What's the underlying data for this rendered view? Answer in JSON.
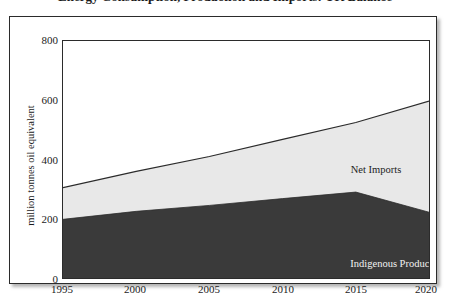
{
  "figure": {
    "title": "Energy Consumption, Production and Imports: UK Balance",
    "title_clipped": true,
    "background_color": "#ffffff",
    "frame_color": "#2b2b2b"
  },
  "chart_data": {
    "type": "area",
    "stacked": true,
    "title": "Energy Consumption, Production and Imports: UK Balance",
    "xlabel": "",
    "ylabel": "million tonnes oil equivalent",
    "x": [
      1995,
      2000,
      2005,
      2010,
      2015,
      2020
    ],
    "xlim": [
      1995,
      2020
    ],
    "ylim": [
      0,
      800
    ],
    "xticks": [
      "1995",
      "2000",
      "2005",
      "2010",
      "2015",
      "2020"
    ],
    "yticks": [
      "0",
      "200",
      "400",
      "600",
      "800"
    ],
    "ytick_values": [
      0,
      200,
      400,
      600,
      800
    ],
    "grid": false,
    "legend_position": "inline-annotation",
    "series": [
      {
        "name": "Indigenous Production",
        "values": [
          198,
          225,
          245,
          268,
          290,
          222
        ],
        "color": "#3a3a3a",
        "label_color": "#f2f2f2"
      },
      {
        "name": "Net Imports",
        "values": [
          107,
          135,
          165,
          200,
          235,
          375
        ],
        "color": "#e8e8e8",
        "label_color": "#1c1c1c"
      }
    ],
    "total_line": {
      "name": "Total Consumption",
      "values": [
        305,
        360,
        410,
        468,
        525,
        597
      ],
      "color": "#2b2b2b"
    },
    "annotations": [
      {
        "text": "Net Imports",
        "x": 2017,
        "y": 430
      },
      {
        "text": "Indigenous Production",
        "x": 2018,
        "y": 135
      }
    ]
  },
  "axis": {
    "y_label": "million tonnes oil equivalent",
    "y_ticks": [
      "800",
      "600",
      "400",
      "200",
      "0"
    ],
    "x_ticks": [
      "1995",
      "2000",
      "2005",
      "2010",
      "2015",
      "2020"
    ]
  }
}
